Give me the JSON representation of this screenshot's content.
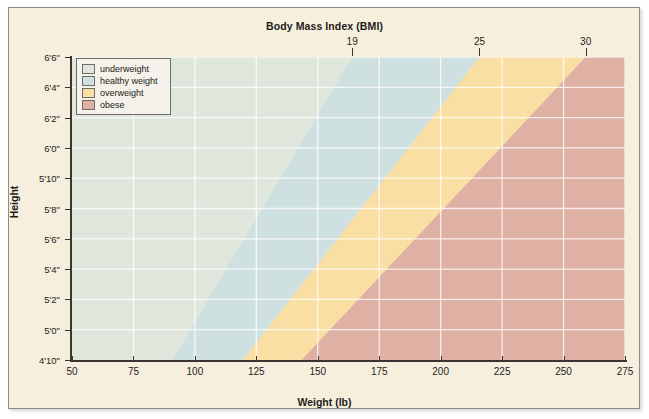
{
  "figure": {
    "paper_color": "#f7efde",
    "border_color": "#8d8b85"
  },
  "titles": {
    "top_axis": "Body Mass Index (BMI)",
    "x_axis": "Weight (lb)",
    "y_axis": "Height"
  },
  "legend": {
    "items": [
      {
        "label": "underweight",
        "color": "#dfe7dc"
      },
      {
        "label": "healthy weight",
        "color": "#cfe0e1"
      },
      {
        "label": "overweight",
        "color": "#f9dfa4"
      },
      {
        "label": "obese",
        "color": "#dfb0a4"
      }
    ]
  },
  "chart_data": {
    "type": "area",
    "title": "Body Mass Index (BMI)",
    "xlabel": "Weight (lb)",
    "ylabel": "Height",
    "xlim": [
      50,
      275
    ],
    "ylim_inches": [
      58,
      78
    ],
    "grid": true,
    "legend_position": "top-left inside plot",
    "x_ticks": [
      50,
      75,
      100,
      125,
      150,
      175,
      200,
      225,
      250,
      275
    ],
    "x_tick_labels": [
      "50",
      "75",
      "100",
      "125",
      "150",
      "175",
      "200",
      "225",
      "250",
      "275"
    ],
    "y_ticks_inches": [
      58,
      60,
      62,
      64,
      66,
      68,
      70,
      72,
      74,
      76,
      78
    ],
    "y_tick_labels": [
      "4'10\"",
      "5'0\"",
      "5'2\"",
      "5'4\"",
      "5'6\"",
      "5'8\"",
      "5'10\"",
      "6'0\"",
      "6'2\"",
      "6'4\"",
      "6'6\""
    ],
    "top_axis_ticks_bmi": [
      19,
      25,
      30
    ],
    "top_axis_tick_labels": [
      "19",
      "25",
      "30"
    ],
    "top_axis_tick_weights_lb": [
      164.0,
      215.8,
      259.0
    ],
    "bands": [
      {
        "name": "underweight",
        "color": "#dfe7dc",
        "bmi_range": [
          0,
          19
        ],
        "boundary_weight_at_bottom_lb": 90.8,
        "boundary_weight_at_top_lb": 164.0
      },
      {
        "name": "healthy weight",
        "color": "#cfe0e1",
        "bmi_range": [
          19,
          25
        ],
        "boundary_weight_at_bottom_lb": 119.5,
        "boundary_weight_at_top_lb": 215.8
      },
      {
        "name": "overweight",
        "color": "#f9dfa4",
        "bmi_range": [
          25,
          30
        ],
        "boundary_weight_at_bottom_lb": 143.4,
        "boundary_weight_at_top_lb": 259.0
      },
      {
        "name": "obese",
        "color": "#dfb0a4",
        "bmi_range": [
          30,
          99
        ],
        "boundary_weight_at_bottom_lb": 275,
        "boundary_weight_at_top_lb": 275
      }
    ]
  }
}
